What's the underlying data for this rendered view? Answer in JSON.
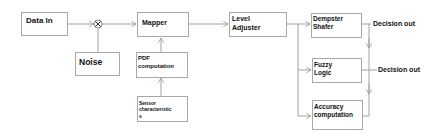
{
  "diagram": {
    "nodes": {
      "data_in": {
        "label": "Data In"
      },
      "noise": {
        "label": "Noise"
      },
      "mixer": {
        "symbol": "⊗"
      },
      "mapper": {
        "label": "Mapper"
      },
      "pdf": {
        "line1": "PDF",
        "line2": "computation"
      },
      "sensor": {
        "line1": "Sensor",
        "line2": "characteristic",
        "line3": "s"
      },
      "level": {
        "line1": "Level",
        "line2": "Adjuster"
      },
      "dempster": {
        "line1": "Dempster",
        "line2": "Shafer"
      },
      "fuzzy": {
        "line1": "Fuzzy",
        "line2": "Logic"
      },
      "accuracy": {
        "line1": "Accuracy",
        "line2": "computation"
      }
    },
    "outputs": {
      "out1": "Decision out",
      "out2": "Decision out"
    },
    "colors": {
      "line": "#a0a0a0",
      "border": "#a8a8a8",
      "text": "#111111"
    }
  }
}
